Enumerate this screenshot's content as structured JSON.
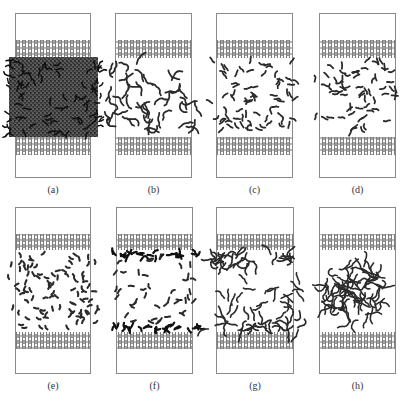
{
  "figure": {
    "panels": [
      {
        "id": "a",
        "label": "(a)",
        "box": [
          15,
          13,
          76,
          165
        ],
        "bands": [
          [
            40,
            58
          ],
          [
            137,
            155
          ]
        ],
        "mol": {
          "mode": "dense",
          "region": [
            7,
            57,
            100,
            137
          ],
          "count": 0
        }
      },
      {
        "id": "b",
        "label": "(b)",
        "box": [
          115,
          13,
          77,
          165
        ],
        "bands": [
          [
            40,
            58
          ],
          [
            137,
            155
          ]
        ],
        "mol": {
          "mode": "chains",
          "region": [
            108,
            62,
            200,
            130
          ],
          "count": 46,
          "len": 6
        }
      },
      {
        "id": "c",
        "label": "(c)",
        "box": [
          216,
          13,
          77,
          165
        ],
        "bands": [
          [
            40,
            58
          ],
          [
            137,
            155
          ]
        ],
        "mol": {
          "mode": "clusters",
          "region": [
            212,
            62,
            298,
            132
          ],
          "count": 70,
          "len": 3
        }
      },
      {
        "id": "d",
        "label": "(d)",
        "box": [
          319,
          13,
          77,
          165
        ],
        "bands": [
          [
            40,
            58
          ],
          [
            137,
            155
          ]
        ],
        "mol": {
          "mode": "clusters",
          "region": [
            314,
            62,
            398,
            133
          ],
          "count": 64,
          "len": 3
        }
      },
      {
        "id": "e",
        "label": "(e)",
        "box": [
          15,
          207,
          76,
          167
        ],
        "bands": [
          [
            234,
            250
          ],
          [
            332,
            349
          ]
        ],
        "mol": {
          "mode": "short",
          "region": [
            8,
            253,
            98,
            330
          ],
          "count": 95,
          "len": 2
        }
      },
      {
        "id": "f",
        "label": "(f)",
        "box": [
          116,
          207,
          77,
          167
        ],
        "bands": [
          [
            234,
            250
          ],
          [
            332,
            349
          ]
        ],
        "mol": {
          "mode": "walls",
          "region": [
            110,
            253,
            200,
            330
          ],
          "count": 70,
          "len": 2
        }
      },
      {
        "id": "g",
        "label": "(g)",
        "box": [
          216,
          207,
          78,
          167
        ],
        "bands": [
          [
            234,
            250
          ],
          [
            332,
            349
          ]
        ],
        "mol": {
          "mode": "gwalls",
          "region": [
            208,
            252,
            300,
            331
          ],
          "count": 70,
          "len": 5
        }
      },
      {
        "id": "h",
        "label": "(h)",
        "box": [
          319,
          207,
          77,
          167
        ],
        "bands": [
          [
            234,
            250
          ],
          [
            332,
            349
          ]
        ],
        "mol": {
          "mode": "ball",
          "region": [
            312,
            252,
            400,
            330
          ],
          "count": 75,
          "len": 7
        }
      }
    ],
    "label_offset_y": 12
  },
  "colors": {
    "box_border": "#8a8a8a",
    "graphene": "#7d7d7d",
    "molecule": "#2a2a2a",
    "molecule_dark": "#111111",
    "label": "#333333"
  }
}
